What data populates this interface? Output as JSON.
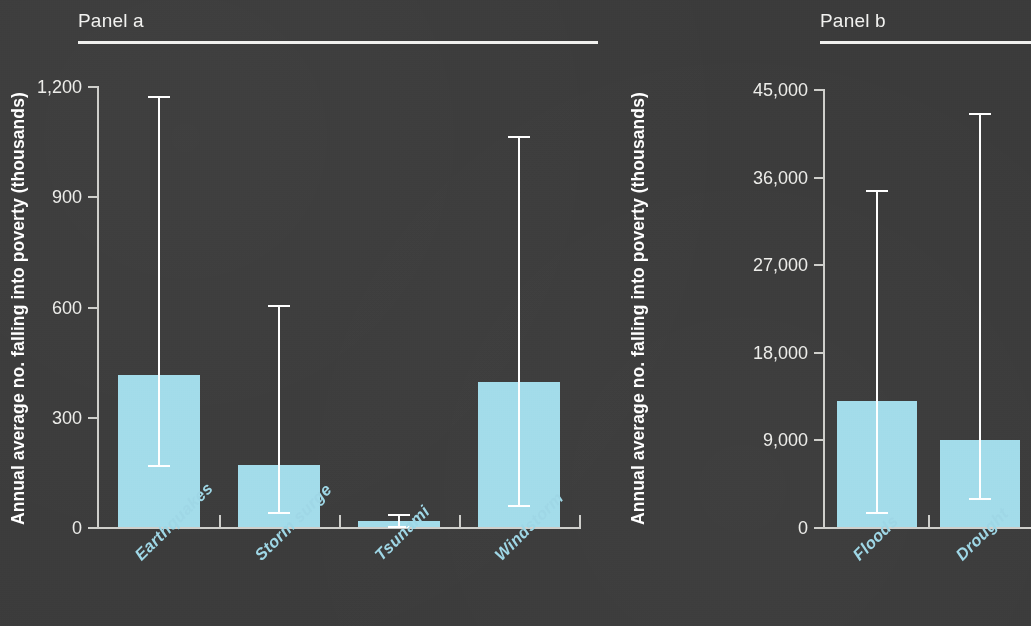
{
  "figure": {
    "background_color": "#3b3b3b",
    "bar_color": "#a3dcea",
    "axis_color": "#cfcfcb",
    "label_color": "#9fd7e6",
    "axis_title_color": "#ffffff"
  },
  "panel_a": {
    "title": "Panel a",
    "axis_title": "Annual average no. falling into poverty (thousands)"
  },
  "panel_b": {
    "title": "Panel b",
    "axis_title": "Annual average no. falling into poverty (thousands)"
  },
  "chart_data": [
    {
      "type": "bar",
      "title": "Panel a",
      "xlabel": "",
      "ylabel": "Annual average no. falling into poverty (thousands)",
      "ylim": [
        0,
        1200
      ],
      "yticks": [
        0,
        300,
        600,
        900,
        1200
      ],
      "ytick_labels": [
        "0",
        "300",
        "600",
        "900",
        "1,200"
      ],
      "grid": false,
      "legend": "none",
      "error_bars": true,
      "categories": [
        "Earthquakes",
        "Storm surge",
        "Tsunami",
        "Windstorm"
      ],
      "values": [
        414,
        170,
        16,
        395
      ],
      "error_low": [
        169,
        42,
        4,
        61
      ],
      "error_high": [
        1173,
        604,
        35,
        1064
      ]
    },
    {
      "type": "bar",
      "title": "Panel b",
      "xlabel": "",
      "ylabel": "Annual average no. falling into poverty (thousands)",
      "ylim": [
        0,
        45000
      ],
      "yticks": [
        0,
        9000,
        18000,
        27000,
        36000,
        45000
      ],
      "ytick_labels": [
        "0",
        "9,000",
        "18,000",
        "27,000",
        "36,000",
        "45,000"
      ],
      "grid": false,
      "legend": "none",
      "error_bars": true,
      "categories": [
        "Floods",
        "Drought"
      ],
      "values": [
        12950,
        8950
      ],
      "error_low": [
        1540,
        2980
      ],
      "error_high": [
        34600,
        42500
      ]
    }
  ]
}
